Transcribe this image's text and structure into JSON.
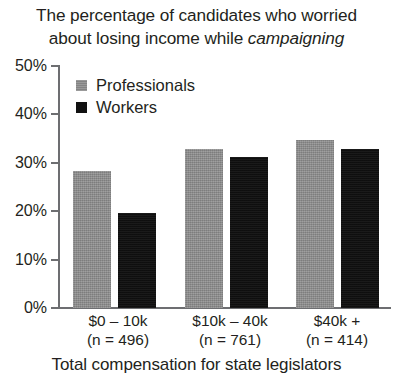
{
  "chart_data": {
    "type": "bar",
    "title": "The percentage of candidates who worried about losing income while campaigning",
    "title_line1": "The percentage of candidates who worried",
    "title_line2_plain": "about losing income while ",
    "title_line2_em": "campaigning",
    "xlabel": "Total compensation for state legislators",
    "ylabel": "",
    "ylim": [
      0,
      50
    ],
    "ytick_labels": [
      "50%",
      "40%",
      "30%",
      "20%",
      "10%",
      "0%"
    ],
    "ytick_values": [
      50,
      40,
      30,
      20,
      10,
      0
    ],
    "grid": false,
    "legend_position": "top-left-inside",
    "categories": [
      "$0 – 10k",
      "$10k – 40k",
      "$40k +"
    ],
    "category_sublabels": [
      "(n = 496)",
      "(n = 761)",
      "(n = 414)"
    ],
    "category_n": [
      496,
      761,
      414
    ],
    "series": [
      {
        "name": "Professionals",
        "color": "#8c8c8c",
        "values": [
          28.3,
          32.9,
          34.7
        ]
      },
      {
        "name": "Workers",
        "color": "#111111",
        "values": [
          19.6,
          31.2,
          32.9
        ]
      }
    ]
  },
  "bars": [
    {
      "label": "prof-0-10k",
      "series": "Professionals",
      "category": "$0 – 10k",
      "value": 28.3
    },
    {
      "label": "work-0-10k",
      "series": "Workers",
      "category": "$0 – 10k",
      "value": 19.6
    },
    {
      "label": "prof-10-40k",
      "series": "Professionals",
      "category": "$10k – 40k",
      "value": 32.9
    },
    {
      "label": "work-10-40k",
      "series": "Workers",
      "category": "$10k – 40k",
      "value": 31.2
    },
    {
      "label": "prof-40k",
      "series": "Professionals",
      "category": "$40k +",
      "value": 34.7
    },
    {
      "label": "work-40k",
      "series": "Workers",
      "category": "$40k +",
      "value": 32.9
    }
  ]
}
